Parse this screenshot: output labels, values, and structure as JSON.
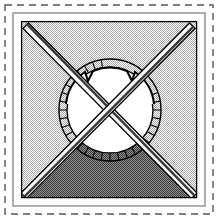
{
  "figure": {
    "title": "Heraldic shield emblem with saltire and crowned roundel",
    "canvas": {
      "width": 218,
      "height": 219,
      "background": "#ffffff"
    },
    "palette": {
      "ink": "#000000",
      "paper": "#ffffff",
      "field_dither": "#b8b8b8",
      "shaded_dither": "#6f6f6f",
      "bar_shadow": "#404040",
      "bar_fill": "#fcfcfc",
      "dash_border": "#555555",
      "inner_border": "#999999"
    },
    "outer_dashed_frame": {
      "name": "dashed-frame",
      "x": 5,
      "y": 5,
      "width": 208,
      "height": 209,
      "stroke": "#555555",
      "stroke_width": 1.4,
      "dash_pattern": "7 5"
    },
    "inner_frame": {
      "name": "inner-frame",
      "x": 13,
      "y": 13,
      "width": 192,
      "height": 193,
      "stroke": "#9a9a9a",
      "stroke_width": 1.6
    },
    "field_panel": {
      "name": "hatched-field",
      "x": 21,
      "y": 21,
      "width": 176,
      "height": 177,
      "fill_pattern": "fine-dither-light",
      "stroke": "#000000",
      "stroke_width": 1.2
    },
    "shaded_triangle": {
      "name": "base-triangle",
      "fill_pattern": "fine-dither-dark",
      "points": "22,197 108,113 196,197"
    },
    "saltire_bars": [
      {
        "name": "bar-nw-se",
        "from": {
          "x": 24,
          "y": 24
        },
        "to": {
          "x": 194,
          "y": 195
        },
        "width": 9,
        "fill": "#fcfcfc",
        "shadow": "#3a3a3a",
        "stroke": "#000000"
      },
      {
        "name": "bar-ne-sw",
        "from": {
          "x": 194,
          "y": 24
        },
        "to": {
          "x": 24,
          "y": 195
        },
        "width": 9,
        "fill": "#fcfcfc",
        "shadow": "#3a3a3a",
        "stroke": "#000000"
      }
    ],
    "crossing_point": {
      "x": 109,
      "y": 110
    },
    "roundel": {
      "name": "ticked-roundel",
      "center": {
        "x": 110,
        "y": 110
      },
      "outer_radius": 51,
      "inner_radius": 43,
      "ring_stroke": "#000000",
      "ring_stroke_width": 1.5,
      "interior_fill": "#ffffff",
      "tick_count": 36,
      "tick_stroke": "#000000",
      "tick_stroke_width": 1.1,
      "crown_notches": [
        {
          "name": "notch-left",
          "angle_deg": -122
        },
        {
          "name": "notch-right",
          "angle_deg": -58
        }
      ],
      "notch_depth": 9,
      "notch_width_deg": 9
    }
  },
  "a11y": {
    "figure_label": "Emblem drawing",
    "frame_label": "Dashed outer frame",
    "field_label": "Dotted field panel",
    "triangle_label": "Shaded base triangle",
    "bar_nw_label": "Diagonal bar, top-left to bottom-right",
    "bar_ne_label": "Diagonal bar, top-right to bottom-left",
    "roundel_label": "Circular dial with radial ticks and crown notches"
  }
}
